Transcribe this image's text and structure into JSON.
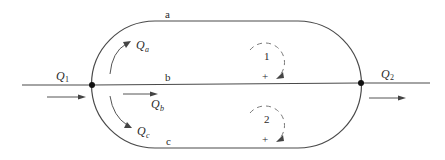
{
  "diagram": {
    "type": "pipe network / flow loop diagram",
    "branch_labels": {
      "top": "a",
      "middle": "b",
      "bottom": "c"
    },
    "flows": {
      "inflow": {
        "symbol": "Q",
        "subscript": "1"
      },
      "outflow": {
        "symbol": "Q",
        "subscript": "2"
      },
      "branch_a": {
        "symbol": "Q",
        "subscript": "a"
      },
      "branch_b": {
        "symbol": "Q",
        "subscript": "b"
      },
      "branch_c": {
        "symbol": "Q",
        "subscript": "c"
      }
    },
    "loops": [
      {
        "id": "1",
        "sign": "+",
        "direction": "clockwise"
      },
      {
        "id": "2",
        "sign": "+",
        "direction": "clockwise"
      }
    ],
    "colors": {
      "line": "#4a4a4a",
      "node": "#111111",
      "dashed_loop": "#7a7a7a",
      "text": "#2a2a2a"
    }
  }
}
